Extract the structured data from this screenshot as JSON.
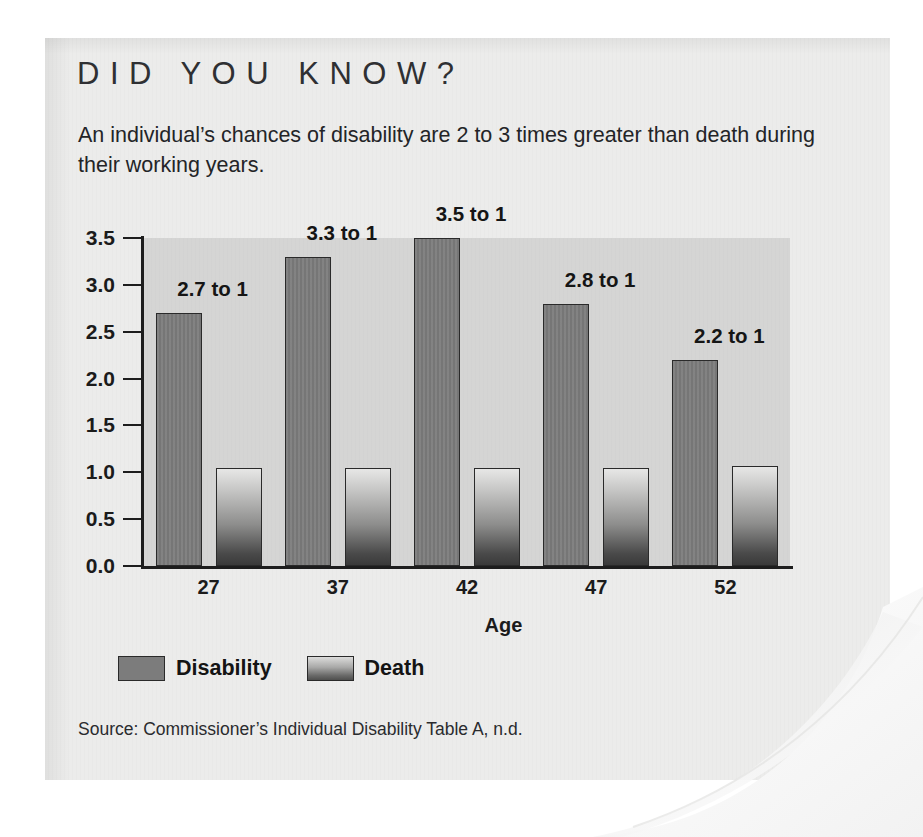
{
  "card": {
    "title": "DID YOU KNOW?",
    "subtitle": "An individual’s chances of disability are 2 to 3 times greater than death during their working years.",
    "source": "Source: Commissioner’s Individual Disability Table A, n.d."
  },
  "colors": {
    "page_background": "#ffffff",
    "card_background": "#ececeb",
    "plot_background": "#d5d5d4",
    "disability_bar": "#7c7c7c",
    "death_bar_top": "#e7e7e6",
    "death_bar_bottom": "#3a3a3a",
    "axis": "#1d1d1d",
    "text": "#1b1b1b"
  },
  "chart_data": {
    "type": "bar",
    "title": "",
    "xlabel": "Age",
    "ylabel": "",
    "categories": [
      "27",
      "37",
      "42",
      "47",
      "52"
    ],
    "series": [
      {
        "name": "Disability",
        "values": [
          2.7,
          3.3,
          3.5,
          2.8,
          2.2
        ]
      },
      {
        "name": "Death",
        "values": [
          1.05,
          1.05,
          1.05,
          1.05,
          1.07
        ]
      }
    ],
    "point_labels": [
      "2.7 to 1",
      "3.3 to 1",
      "3.5 to 1",
      "2.8 to 1",
      "2.2 to 1"
    ],
    "ylim": [
      0.0,
      3.5
    ],
    "ytick_labels": [
      "0.0",
      "0.5",
      "1.0",
      "1.5",
      "2.0",
      "2.5",
      "3.0",
      "3.5"
    ],
    "yticks": [
      0.0,
      0.5,
      1.0,
      1.5,
      2.0,
      2.5,
      3.0,
      3.5
    ],
    "grid": false,
    "legend_position": "bottom-left",
    "legend": [
      "Disability",
      "Death"
    ]
  }
}
